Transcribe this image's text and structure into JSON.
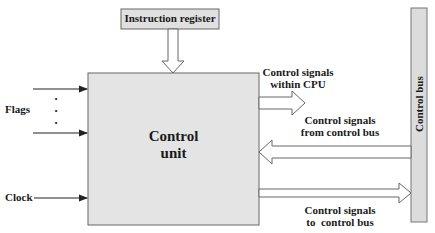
{
  "diagram": {
    "colors": {
      "box_fill": "#e4e4e4",
      "register_fill": "#e0e0e0",
      "bus_fill": "#dcdcdc",
      "stroke": "#555555",
      "arrow_fill": "#ffffff",
      "text": "#1a1a1a"
    },
    "nodes": {
      "instruction_register": {
        "label": "Instruction register"
      },
      "control_unit": {
        "line1": "Control",
        "line2": "unit"
      },
      "control_bus": {
        "label": "Control bus"
      }
    },
    "inputs": {
      "flags": {
        "label": "Flags",
        "dots": "•"
      },
      "clock": {
        "label": "Clock"
      }
    },
    "outputs": {
      "within_cpu": {
        "line1": "Control signals",
        "line2": "within CPU"
      },
      "from_bus": {
        "line1": "Control signals",
        "line2": "from control bus"
      },
      "to_bus": {
        "line1": "Control signals",
        "line2": "to  control bus"
      }
    }
  }
}
